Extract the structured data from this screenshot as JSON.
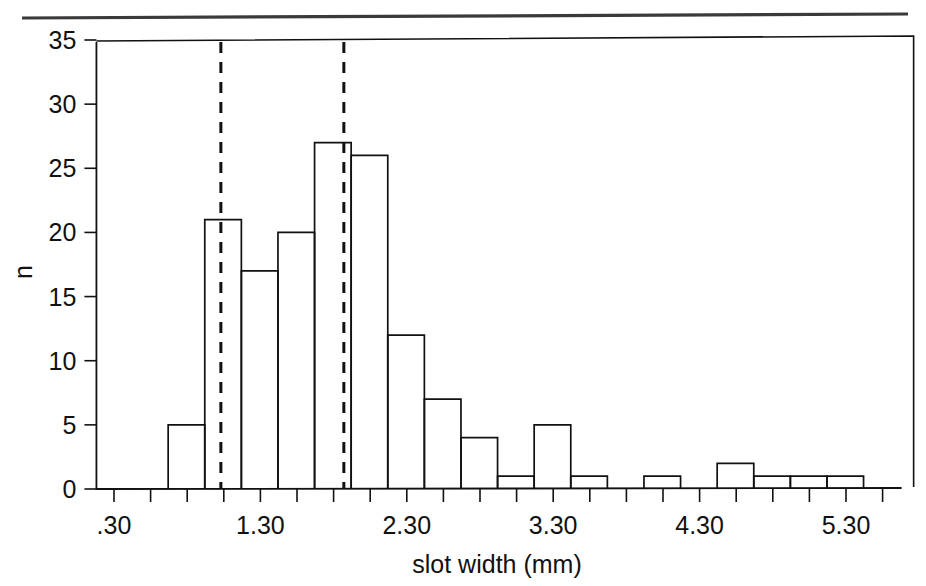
{
  "figure": {
    "background_color": "#ffffff",
    "ink_color": "#111111",
    "header_rule_color": "#3a3a3a",
    "header_rule_present": true
  },
  "chart_data": {
    "type": "bar",
    "subtype": "histogram",
    "title": "",
    "xlabel": "slot width (mm)",
    "ylabel": "n",
    "xlim": [
      0.18,
      5.68
    ],
    "ylim": [
      0,
      35
    ],
    "grid": false,
    "legend": false,
    "bin_width": 0.25,
    "x_tick_labels": [
      ".30",
      "1.30",
      "2.30",
      "3.30",
      "4.30",
      "5.30"
    ],
    "x_tick_values": [
      0.3,
      1.3,
      2.3,
      3.3,
      4.3,
      5.3
    ],
    "x_minor_tick_values": [
      0.3,
      0.55,
      0.8,
      1.05,
      1.3,
      1.55,
      1.8,
      2.05,
      2.3,
      2.55,
      2.8,
      3.05,
      3.3,
      3.55,
      3.8,
      4.05,
      4.3,
      4.55,
      4.8,
      5.05,
      5.3,
      5.55
    ],
    "y_tick_labels": [
      "0",
      "5",
      "10",
      "15",
      "20",
      "25",
      "30",
      "35"
    ],
    "y_tick_values": [
      0,
      5,
      10,
      15,
      20,
      25,
      30,
      35
    ],
    "bins": [
      {
        "left": 0.42,
        "right": 0.67,
        "count": 0
      },
      {
        "left": 0.67,
        "right": 0.92,
        "count": 5
      },
      {
        "left": 0.92,
        "right": 1.17,
        "count": 21
      },
      {
        "left": 1.17,
        "right": 1.42,
        "count": 17
      },
      {
        "left": 1.42,
        "right": 1.67,
        "count": 20
      },
      {
        "left": 1.67,
        "right": 1.92,
        "count": 27
      },
      {
        "left": 1.92,
        "right": 2.17,
        "count": 26
      },
      {
        "left": 2.17,
        "right": 2.42,
        "count": 12
      },
      {
        "left": 2.42,
        "right": 2.67,
        "count": 7
      },
      {
        "left": 2.67,
        "right": 2.92,
        "count": 4
      },
      {
        "left": 2.92,
        "right": 3.17,
        "count": 1
      },
      {
        "left": 3.17,
        "right": 3.42,
        "count": 5
      },
      {
        "left": 3.42,
        "right": 3.67,
        "count": 1
      },
      {
        "left": 3.67,
        "right": 3.92,
        "count": 0
      },
      {
        "left": 3.92,
        "right": 4.17,
        "count": 1
      },
      {
        "left": 4.17,
        "right": 4.42,
        "count": 0
      },
      {
        "left": 4.42,
        "right": 4.67,
        "count": 2
      },
      {
        "left": 4.67,
        "right": 4.92,
        "count": 1
      },
      {
        "left": 4.92,
        "right": 5.17,
        "count": 1
      },
      {
        "left": 5.17,
        "right": 5.42,
        "count": 1
      }
    ],
    "reference_lines": [
      {
        "name": "left-dashed-reference-line",
        "x": 1.03,
        "style": "dashed"
      },
      {
        "name": "right-dashed-reference-line",
        "x": 1.87,
        "style": "dashed"
      }
    ]
  }
}
